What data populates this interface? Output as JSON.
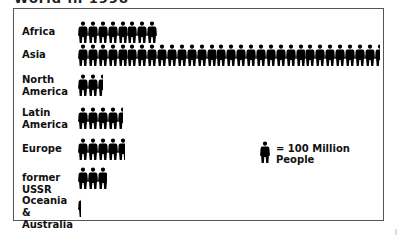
{
  "title": "World in 1998",
  "legend": {
    "unit_value": 100,
    "text": "= 100 Million People",
    "icon": "person-icon"
  },
  "rows": [
    {
      "label": "Africa",
      "figures": 8,
      "top": 12
    },
    {
      "label": "Asia",
      "figures": 30.5,
      "top": 35
    },
    {
      "label": "North America",
      "label_lines": [
        "North",
        "America"
      ],
      "figures": 2.5,
      "top": 65
    },
    {
      "label": "Latin America",
      "label_lines": [
        "Latin",
        "America"
      ],
      "figures": 4.5,
      "top": 98
    },
    {
      "label": "Europe",
      "figures": 4.8,
      "top": 129
    },
    {
      "label": "former USSR",
      "figures": 2.9,
      "top": 158
    },
    {
      "label": "Oceania & Australia",
      "label_lines": [
        "Oceania &",
        "Australia"
      ],
      "figures": 0.3,
      "top": 186
    }
  ],
  "chart_data": {
    "type": "bar",
    "title": "World in 1998",
    "subtitle": "",
    "xlabel": "",
    "ylabel": "",
    "unit": "100 Million People per icon",
    "categories": [
      "Africa",
      "Asia",
      "North America",
      "Latin America",
      "Europe",
      "former USSR",
      "Oceania & Australia"
    ],
    "values": [
      800,
      3050,
      250,
      450,
      480,
      290,
      30
    ],
    "icon_counts": [
      8,
      30.5,
      2.5,
      4.5,
      4.8,
      2.9,
      0.3
    ],
    "legend": "= 100 Million People",
    "legend_position": "right-bottom",
    "grid": false,
    "orientation": "horizontal"
  }
}
